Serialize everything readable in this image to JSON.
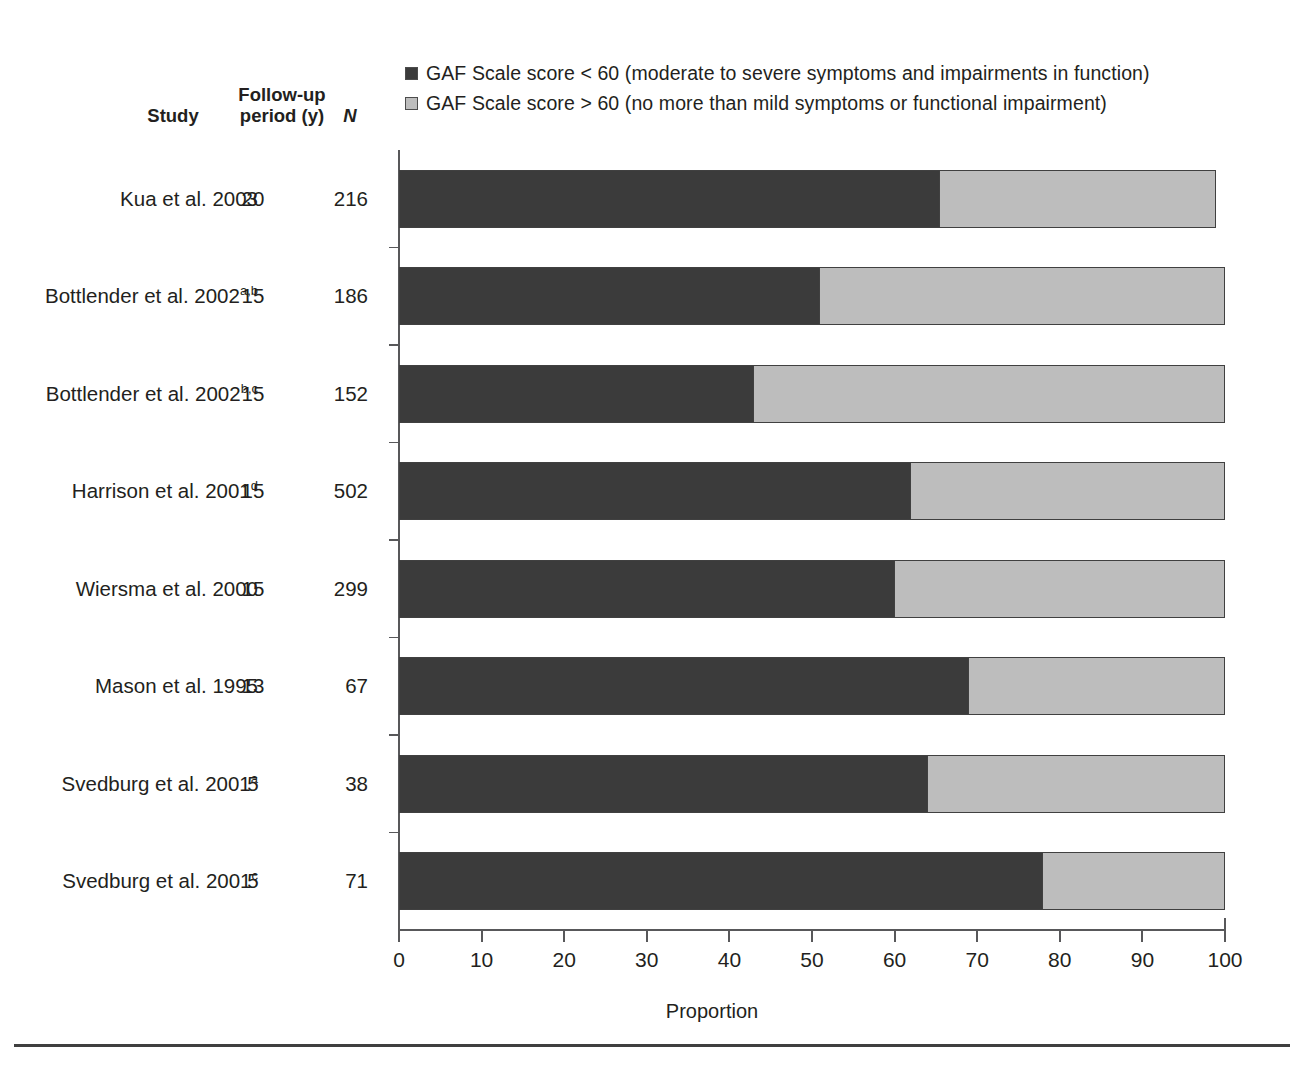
{
  "chart_data": {
    "type": "bar",
    "orientation": "horizontal",
    "stacked": true,
    "title": "",
    "xlabel": "Proportion",
    "ylabel": "",
    "xlim": [
      0,
      100
    ],
    "xticks": [
      0,
      10,
      20,
      30,
      40,
      50,
      60,
      70,
      80,
      90,
      100
    ],
    "grid": false,
    "legend_position": "top",
    "categories": [
      "Kua et al. 2003",
      "Bottlender et al. 2002a,b",
      "Bottlender et al. 2002b,c",
      "Harrison et al. 2001d",
      "Wiersma et al. 2000",
      "Mason et al. 1995",
      "Svedburg et al. 2001a",
      "Svedburg et al. 2001c"
    ],
    "series": [
      {
        "name": "GAF Scale score < 60 (moderate to severe symptoms and impairments in function)",
        "color": "#3b3b3b",
        "values": [
          65.5,
          51.0,
          43.0,
          62.0,
          60.0,
          69.0,
          64.0,
          78.0
        ]
      },
      {
        "name": "GAF Scale score > 60 (no more than mild symptoms or functional impairment)",
        "color": "#bdbdbd",
        "values": [
          33.4,
          49.0,
          57.0,
          38.0,
          40.0,
          31.0,
          36.0,
          22.0
        ]
      }
    ]
  },
  "legend": {
    "items": [
      {
        "swatch_color": "#3b3b3b",
        "label": "GAF Scale score < 60 (moderate to severe symptoms and impairments in function)"
      },
      {
        "swatch_color": "#bdbdbd",
        "label": "GAF Scale score > 60 (no more than mild symptoms or functional impairment)"
      }
    ]
  },
  "columns": {
    "study_header": "Study",
    "followup_header_line1": "Follow-up",
    "followup_header_line2": "period (y)",
    "n_header": "N"
  },
  "rows": [
    {
      "study": "Kua et al. 2003",
      "sup": "",
      "years": "20",
      "n": "216",
      "dark": 65.5,
      "light": 33.4
    },
    {
      "study": "Bottlender et al. 2002",
      "sup": "a,b",
      "years": "15",
      "n": "186",
      "dark": 51.0,
      "light": 49.0
    },
    {
      "study": "Bottlender et al. 2002",
      "sup": "b,c",
      "years": "15",
      "n": "152",
      "dark": 43.0,
      "light": 57.0
    },
    {
      "study": "Harrison et al. 2001",
      "sup": "d",
      "years": "15",
      "n": "502",
      "dark": 62.0,
      "light": 38.0
    },
    {
      "study": "Wiersma et al. 2000",
      "sup": "",
      "years": "15",
      "n": "299",
      "dark": 60.0,
      "light": 40.0
    },
    {
      "study": "Mason et al. 1995",
      "sup": "",
      "years": "13",
      "n": "67",
      "dark": 69.0,
      "light": 31.0
    },
    {
      "study": "Svedburg et al. 2001",
      "sup": "a",
      "years": "5",
      "n": "38",
      "dark": 64.0,
      "light": 36.0
    },
    {
      "study": "Svedburg et al. 2001",
      "sup": "c",
      "years": "5",
      "n": "71",
      "dark": 78.0,
      "light": 22.0
    }
  ],
  "axis": {
    "x_title": "Proportion",
    "x_ticklabels": [
      "0",
      "10",
      "20",
      "30",
      "40",
      "50",
      "60",
      "70",
      "80",
      "90",
      "100"
    ]
  },
  "colors": {
    "dark_segment": "#3b3b3b",
    "light_segment": "#bdbdbd",
    "axis": "#58585a",
    "text": "#231f20",
    "rule": "#3f3f3f"
  }
}
